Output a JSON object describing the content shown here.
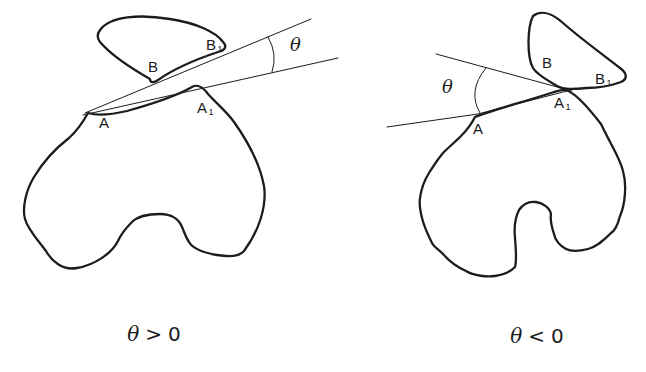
{
  "colors": {
    "ink": "#1c1c1c",
    "background": "#ffffff"
  },
  "panels": [
    {
      "id": "theta-positive",
      "angle_label": "θ",
      "caption": {
        "symbol": "θ",
        "relation": ">",
        "value": "0"
      },
      "labels": {
        "B": {
          "text": "B",
          "sub": ""
        },
        "B1": {
          "text": "B",
          "sub": "1"
        },
        "A": {
          "text": "A",
          "sub": ""
        },
        "A1": {
          "text": "A",
          "sub": "1"
        }
      }
    },
    {
      "id": "theta-negative",
      "angle_label": "θ",
      "caption": {
        "symbol": "θ",
        "relation": "<",
        "value": "0"
      },
      "labels": {
        "B": {
          "text": "B",
          "sub": ""
        },
        "B1": {
          "text": "B",
          "sub": "1"
        },
        "A": {
          "text": "A",
          "sub": ""
        },
        "A1": {
          "text": "A",
          "sub": "1"
        }
      }
    }
  ]
}
